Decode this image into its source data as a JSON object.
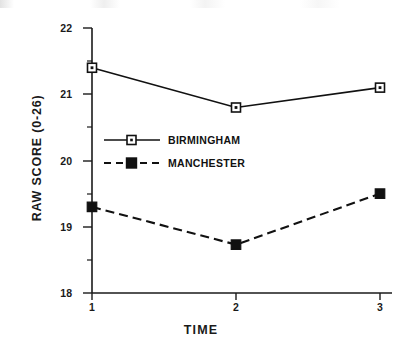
{
  "chart_data": {
    "type": "line",
    "title": "",
    "xlabel": "TIME",
    "ylabel": "RAW SCORE  (0-26)",
    "x": [
      1,
      2,
      3
    ],
    "categories": [
      "1",
      "2",
      "3"
    ],
    "xtick_labels": [
      "1",
      "2",
      "3"
    ],
    "ytick_labels": [
      "18",
      "19",
      "20",
      "21",
      "22"
    ],
    "yticks": [
      18,
      19,
      20,
      21,
      22
    ],
    "y_minor_ticks": [
      18.5,
      19.5,
      20.5,
      21.5
    ],
    "xlim": [
      1,
      3
    ],
    "ylim": [
      18,
      22
    ],
    "grid": false,
    "legend_position": "center-left-inside",
    "series": [
      {
        "name": "BIRMINGHAM",
        "values": [
          21.4,
          20.8,
          21.1
        ],
        "line_style": "solid",
        "marker": "open-square",
        "color": "#111111"
      },
      {
        "name": "MANCHESTER",
        "values": [
          19.3,
          18.73,
          19.5
        ],
        "line_style": "dashed",
        "marker": "filled-square",
        "color": "#111111"
      }
    ]
  },
  "legend": {
    "entries": [
      {
        "label": "BIRMINGHAM"
      },
      {
        "label": "MANCHESTER"
      }
    ]
  },
  "axes": {
    "x_title": "TIME",
    "y_title": "RAW SCORE  (0-26)"
  },
  "ticks": {
    "y": [
      "22",
      "21",
      "20",
      "19",
      "18"
    ],
    "x": [
      "1",
      "2",
      "3"
    ]
  }
}
